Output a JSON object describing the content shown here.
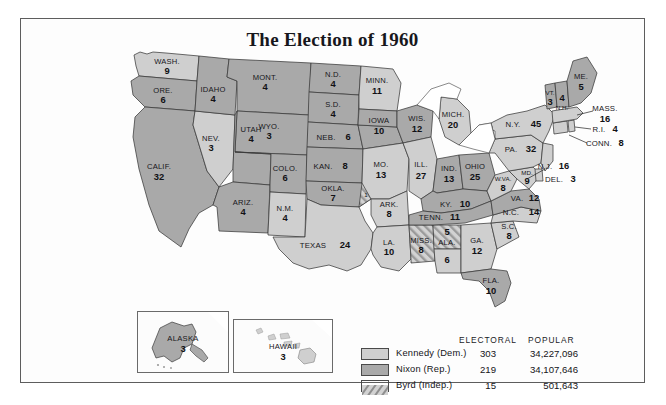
{
  "title": "The Election of 1960",
  "colors": {
    "kennedy": "#cfcfcf",
    "nixon": "#a9a9a9",
    "byrd_hatch": "#bdbdbd",
    "border": "#3a3a3a",
    "frame": "#5d5d5d",
    "text": "#16161a",
    "background": "#ffffff"
  },
  "legend": {
    "header_electoral": "ELECTORAL",
    "header_popular": "POPULAR",
    "rows": [
      {
        "swatch": "kennedy",
        "name": "Kennedy (Dem.)",
        "electoral": "303",
        "popular": "34,227,096"
      },
      {
        "swatch": "nixon",
        "name": "Nixon (Rep.)",
        "electoral": "219",
        "popular": "34,107,646"
      },
      {
        "swatch": "byrd",
        "name": "Byrd (Indep.)",
        "electoral": "15",
        "popular": "501,643"
      }
    ]
  },
  "insets": [
    {
      "name": "ALASKA",
      "votes": "3",
      "winner": "nixon"
    },
    {
      "name": "HAWAII",
      "votes": "3",
      "winner": "kennedy"
    }
  ],
  "states": [
    {
      "id": "WA",
      "label": "WASH.",
      "votes": "9",
      "winner": "kennedy"
    },
    {
      "id": "OR",
      "label": "ORE.",
      "votes": "6",
      "winner": "nixon"
    },
    {
      "id": "CA",
      "label": "CALIF.",
      "votes": "32",
      "winner": "nixon"
    },
    {
      "id": "NV",
      "label": "NEV.",
      "votes": "3",
      "winner": "kennedy"
    },
    {
      "id": "ID",
      "label": "IDAHO",
      "votes": "4",
      "winner": "nixon"
    },
    {
      "id": "MT",
      "label": "MONT.",
      "votes": "4",
      "winner": "nixon"
    },
    {
      "id": "WY",
      "label": "WYO.",
      "votes": "3",
      "winner": "nixon"
    },
    {
      "id": "UT",
      "label": "UTAH",
      "votes": "4",
      "winner": "nixon"
    },
    {
      "id": "AZ",
      "label": "ARIZ.",
      "votes": "4",
      "winner": "nixon"
    },
    {
      "id": "CO",
      "label": "COLO.",
      "votes": "6",
      "winner": "nixon"
    },
    {
      "id": "NM",
      "label": "N.M.",
      "votes": "4",
      "winner": "kennedy"
    },
    {
      "id": "ND",
      "label": "N.D.",
      "votes": "4",
      "winner": "nixon"
    },
    {
      "id": "SD",
      "label": "S.D.",
      "votes": "4",
      "winner": "nixon"
    },
    {
      "id": "NE",
      "label": "NEB.",
      "votes": "6",
      "winner": "nixon"
    },
    {
      "id": "KS",
      "label": "KAN.",
      "votes": "8",
      "winner": "nixon"
    },
    {
      "id": "OK",
      "label": "OKLA.",
      "votes": "7",
      "winner": "nixon"
    },
    {
      "id": "OK1",
      "label": "",
      "votes": "1",
      "winner": "byrd"
    },
    {
      "id": "TX",
      "label": "TEXAS",
      "votes": "24",
      "winner": "kennedy"
    },
    {
      "id": "MN",
      "label": "MINN.",
      "votes": "11",
      "winner": "kennedy"
    },
    {
      "id": "IA",
      "label": "IOWA",
      "votes": "10",
      "winner": "nixon"
    },
    {
      "id": "MO",
      "label": "MO.",
      "votes": "13",
      "winner": "kennedy"
    },
    {
      "id": "AR",
      "label": "ARK.",
      "votes": "8",
      "winner": "kennedy"
    },
    {
      "id": "LA",
      "label": "LA.",
      "votes": "10",
      "winner": "kennedy"
    },
    {
      "id": "WI",
      "label": "WIS.",
      "votes": "12",
      "winner": "nixon"
    },
    {
      "id": "IL",
      "label": "ILL.",
      "votes": "27",
      "winner": "kennedy"
    },
    {
      "id": "MS",
      "label": "MISS.",
      "votes": "8",
      "winner": "byrd"
    },
    {
      "id": "ALb",
      "label": "ALA.",
      "votes": "5",
      "winner": "byrd"
    },
    {
      "id": "ALk",
      "label": "",
      "votes": "6",
      "winner": "kennedy"
    },
    {
      "id": "MI",
      "label": "MICH.",
      "votes": "20",
      "winner": "kennedy"
    },
    {
      "id": "IN",
      "label": "IND.",
      "votes": "13",
      "winner": "nixon"
    },
    {
      "id": "OH",
      "label": "OHIO",
      "votes": "25",
      "winner": "nixon"
    },
    {
      "id": "KY",
      "label": "KY.",
      "votes": "10",
      "winner": "nixon"
    },
    {
      "id": "TN",
      "label": "TENN.",
      "votes": "11",
      "winner": "nixon"
    },
    {
      "id": "GA",
      "label": "GA.",
      "votes": "12",
      "winner": "kennedy"
    },
    {
      "id": "FL",
      "label": "FLA.",
      "votes": "10",
      "winner": "nixon"
    },
    {
      "id": "SC",
      "label": "S.C.",
      "votes": "8",
      "winner": "kennedy"
    },
    {
      "id": "NC",
      "label": "N.C.",
      "votes": "14",
      "winner": "kennedy"
    },
    {
      "id": "VA",
      "label": "VA.",
      "votes": "12",
      "winner": "nixon"
    },
    {
      "id": "WV",
      "label": "W.VA.",
      "votes": "8",
      "winner": "kennedy"
    },
    {
      "id": "MD",
      "label": "MD.",
      "votes": "9",
      "winner": "kennedy"
    },
    {
      "id": "DE",
      "label": "DEL.",
      "votes": "3",
      "winner": "kennedy"
    },
    {
      "id": "PA",
      "label": "PA.",
      "votes": "32",
      "winner": "kennedy"
    },
    {
      "id": "NJ",
      "label": "N.J.",
      "votes": "16",
      "winner": "kennedy"
    },
    {
      "id": "NY",
      "label": "N.Y.",
      "votes": "45",
      "winner": "kennedy"
    },
    {
      "id": "CT",
      "label": "CONN.",
      "votes": "8",
      "winner": "kennedy"
    },
    {
      "id": "RI",
      "label": "R.I.",
      "votes": "4",
      "winner": "kennedy"
    },
    {
      "id": "MA",
      "label": "MASS.",
      "votes": "16",
      "winner": "kennedy"
    },
    {
      "id": "VT",
      "label": "VT.",
      "votes": "3",
      "winner": "nixon"
    },
    {
      "id": "NH",
      "label": "N.H.",
      "votes": "4",
      "winner": "nixon"
    },
    {
      "id": "ME",
      "label": "ME.",
      "votes": "5",
      "winner": "nixon"
    }
  ]
}
